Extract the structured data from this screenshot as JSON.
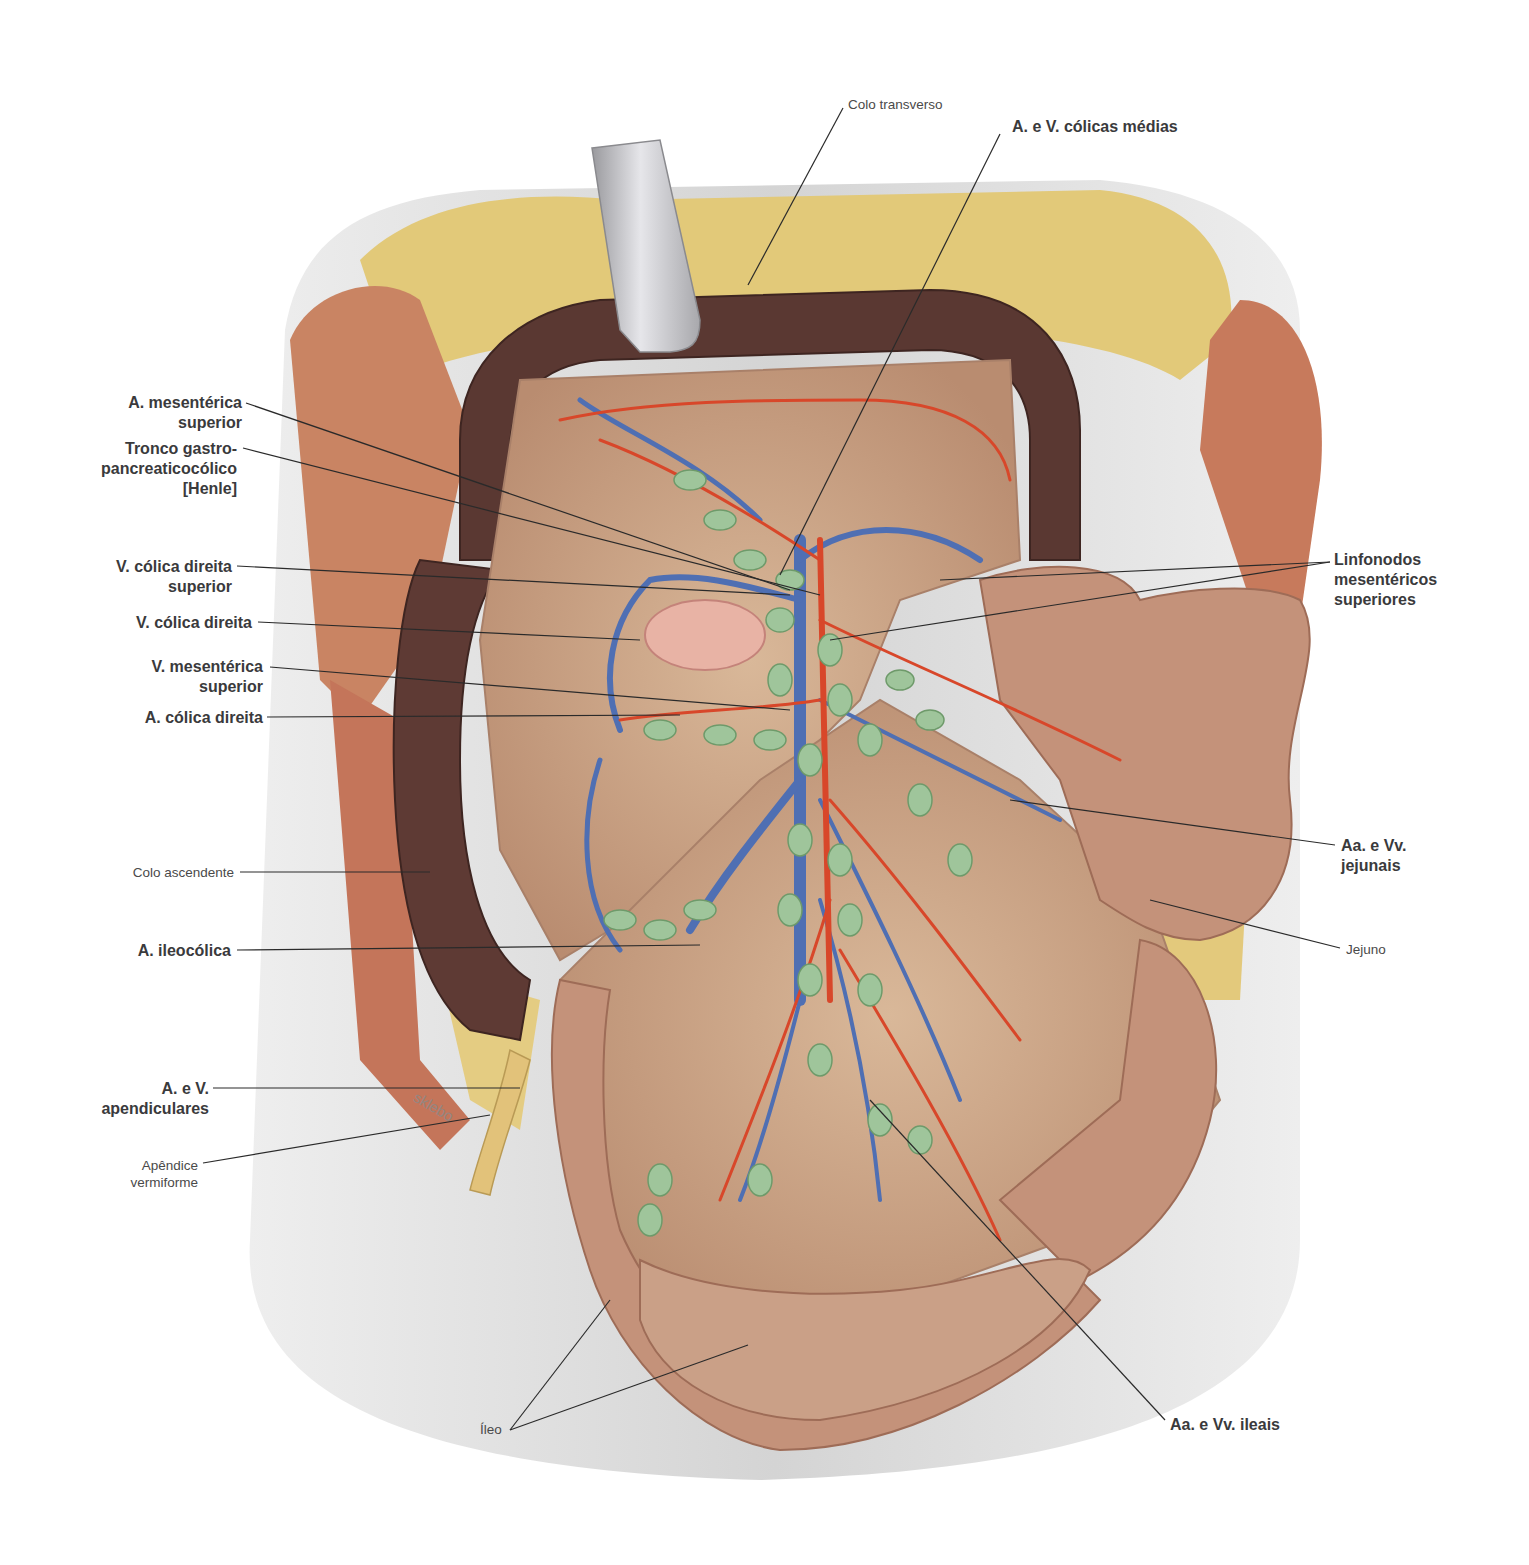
{
  "figure": {
    "watermark": "sklebo",
    "colors": {
      "background": "#ffffff",
      "body_wall": "#dcdcdc",
      "fat": "#e2c979",
      "muscle": "#c77a5c",
      "colon": "#5a3832",
      "mesentery": "#caa48a",
      "intestine": "#c4927a",
      "artery": "#d8472a",
      "vein": "#4f6fb3",
      "lymph_node": "#9fc59b",
      "retractor": "#c9c9cc",
      "leader_line": "#2a2a2a",
      "label_text": "#3a3a3c"
    }
  },
  "labels": {
    "colo_transverso": "Colo transverso",
    "a_v_colicas_medias": "A. e V. cólicas médias",
    "a_mesenterica_superior": "A. mesentérica\nsuperior",
    "tronco_gastro": "Tronco gastro-\npancreaticocólico\n[Henle]",
    "v_colica_direita_superior": "V. cólica direita\nsuperior",
    "v_colica_direita": "V. cólica direita",
    "v_mesenterica_superior": "V. mesentérica\nsuperior",
    "a_colica_direita": "A. cólica direita",
    "colo_ascendente": "Colo ascendente",
    "a_ileocolica": "A. ileocólica",
    "a_v_apendiculares": "A. e V.\napendiculares",
    "apendice_vermiforme": "Apêndice\nvermiforme",
    "ileo": "Íleo",
    "linfonodos": "Linfonodos\nmesentéricos\nsuperiores",
    "aa_vv_jejunais": "Aa. e Vv.\njejunais",
    "jejuno": "Jejuno",
    "aa_vv_ileais": "Aa. e Vv. ileais"
  }
}
